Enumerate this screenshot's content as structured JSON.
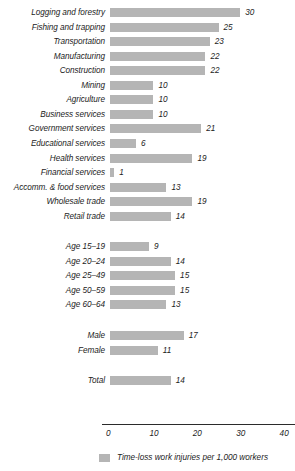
{
  "chart_data": {
    "type": "bar",
    "orientation": "horizontal",
    "title": "",
    "xlabel": "",
    "ylabel": "",
    "xlim": [
      0,
      40
    ],
    "xticks": [
      0,
      10,
      20,
      30,
      40
    ],
    "xtick_labels": [
      "0",
      "10",
      "20",
      "30",
      "40"
    ],
    "grid": false,
    "legend": {
      "position": "bottom",
      "entries": [
        {
          "label": "Time-loss work injuries per 1,000 workers",
          "color": "#b5b5b5"
        }
      ]
    },
    "bar_color": "#b5b5b5",
    "groups": [
      {
        "name": "industry",
        "categories": [
          "Logging and forestry",
          "Fishing and trapping",
          "Transportation",
          "Manufacturing",
          "Construction",
          "Mining",
          "Agriculture",
          "Business services",
          "Government services",
          "Educational services",
          "Health services",
          "Financial services",
          "Accomm. & food services",
          "Wholesale trade",
          "Retail trade"
        ],
        "values": [
          30,
          25,
          23,
          22,
          22,
          10,
          10,
          10,
          21,
          6,
          19,
          1,
          13,
          19,
          14
        ]
      },
      {
        "name": "age",
        "categories": [
          "Age 15–19",
          "Age 20–24",
          "Age 25–49",
          "Age 50–59",
          "Age 60–64"
        ],
        "values": [
          9,
          14,
          15,
          15,
          13
        ]
      },
      {
        "name": "sex",
        "categories": [
          "Male",
          "Female"
        ],
        "values": [
          17,
          11
        ]
      },
      {
        "name": "total",
        "categories": [
          "Total"
        ],
        "values": [
          14
        ]
      }
    ]
  }
}
